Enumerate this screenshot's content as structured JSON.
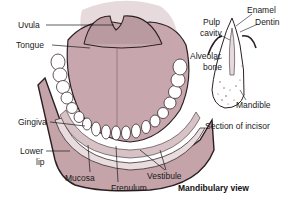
{
  "diagram": {
    "title": "Mandibulary view",
    "main_labels": {
      "uvula": "Uvula",
      "tongue": "Tongue",
      "gingiva": "Gingiva",
      "lower_lip_1": "Lower",
      "lower_lip_2": "lip",
      "mucosa": "Mucosa",
      "frenulum": "Frenulum",
      "vestibule": "Vestibule"
    },
    "incisor": {
      "caption": "Section of incisor",
      "labels": {
        "enamel": "Enamel",
        "dentin": "Dentin",
        "pulp_1": "Pulp",
        "pulp_2": "cavity",
        "alveolar_1": "Alveolar",
        "alveolar_2": "bone",
        "mandible": "Mandible"
      }
    },
    "colors": {
      "tissue": "#c9a9ae",
      "tissue_dark": "#b3939a",
      "palate_bg": "#e3d5d8",
      "teeth": "#ffffff",
      "outline": "#2a1f22"
    }
  }
}
